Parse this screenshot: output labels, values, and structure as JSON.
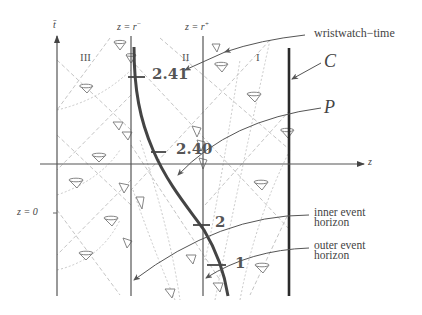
{
  "diagram": {
    "type": "penrose-like spacetime diagram",
    "axes": {
      "vertical_label": "t̄",
      "horizontal_label": "z",
      "left_marker": "z = 0"
    },
    "vertical_lines": [
      {
        "label": "z = r⁻",
        "label_base": "z = r",
        "label_sup": "−"
      },
      {
        "label": "z = r⁺",
        "label_base": "z = r",
        "label_sup": "+"
      }
    ],
    "regions": [
      "III",
      "II",
      "I"
    ],
    "worldline_ticks": [
      "2.41",
      "2.40",
      "2",
      "1"
    ],
    "annotations": {
      "wristwatch": "wristwatch−time",
      "C": "C",
      "P": "P",
      "inner_horizon_line1": "inner event",
      "inner_horizon_line2": "horizon",
      "outer_horizon_line1": "outer event",
      "outer_horizon_line2": "horizon"
    },
    "colors": {
      "axis": "#555555",
      "worldline": "#444444",
      "thick_line_C": "#2a2a2a",
      "dashed": "#b5b5b5",
      "cone": "#777777"
    }
  }
}
